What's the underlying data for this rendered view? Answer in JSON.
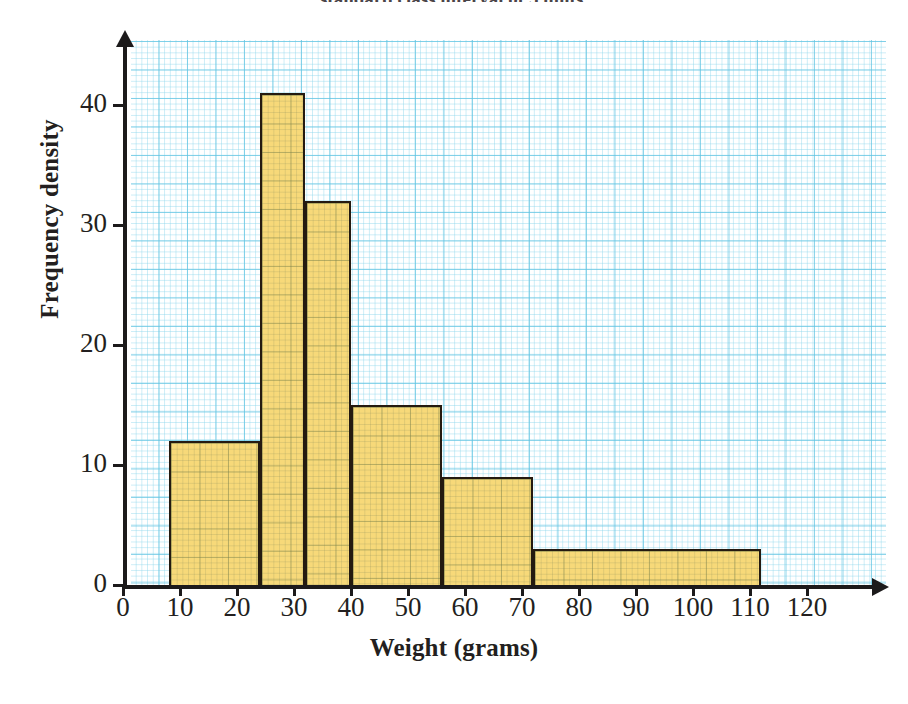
{
  "top_caption": "standard class interval of 5 units.",
  "chart_data": {
    "type": "bar",
    "title": "",
    "xlabel": "Weight (grams)",
    "ylabel": "Frequency density",
    "xlim": [
      0,
      130
    ],
    "ylim": [
      0,
      45
    ],
    "grid": true,
    "legend": "none",
    "x_ticks": [
      0,
      10,
      20,
      30,
      40,
      50,
      60,
      70,
      80,
      90,
      100,
      110,
      120
    ],
    "x_tick_labels": [
      "0",
      "10",
      "20",
      "30",
      "40",
      "50",
      "60",
      "70",
      "80",
      "90",
      "100",
      "110",
      "120"
    ],
    "y_ticks": [
      0,
      10,
      20,
      30,
      40
    ],
    "y_tick_labels": [
      "0",
      "10",
      "20",
      "30",
      "40"
    ],
    "bars": [
      {
        "start": 8,
        "end": 24,
        "value": 12
      },
      {
        "start": 24,
        "end": 32,
        "value": 41
      },
      {
        "start": 32,
        "end": 40,
        "value": 32
      },
      {
        "start": 40,
        "end": 56,
        "value": 15
      },
      {
        "start": 56,
        "end": 72,
        "value": 9
      },
      {
        "start": 72,
        "end": 112,
        "value": 3
      }
    ],
    "colors": {
      "bar_fill": "#f7d979",
      "bar_edge": "#241a10",
      "grid_major": "#60c4e2",
      "grid_minor": "#8cd6ec",
      "axis": "#1c1a1b",
      "text": "#231f20",
      "background": "#ffffff"
    }
  }
}
